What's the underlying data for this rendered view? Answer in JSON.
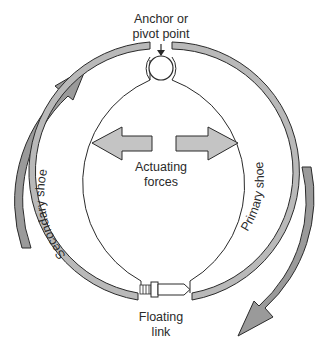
{
  "diagram": {
    "labels": {
      "anchor_line1": "Anchor or",
      "anchor_line2": "pivot point",
      "actuating_line1": "Actuating",
      "actuating_line2": "forces",
      "secondary_shoe": "Secondary shoe",
      "primary_shoe": "Primary shoe",
      "floating_line1": "Floating",
      "floating_line2": "link"
    },
    "components": [
      {
        "id": "anchor-pin",
        "label": "Anchor or pivot point"
      },
      {
        "id": "secondary-shoe",
        "label": "Secondary shoe"
      },
      {
        "id": "primary-shoe",
        "label": "Primary shoe"
      },
      {
        "id": "actuating-force-left",
        "label": "Actuating forces"
      },
      {
        "id": "actuating-force-right",
        "label": "Actuating forces"
      },
      {
        "id": "floating-link",
        "label": "Floating link"
      },
      {
        "id": "rotation-arrow-left",
        "label": "drum rotation"
      },
      {
        "id": "rotation-arrow-right",
        "label": "drum rotation"
      }
    ],
    "colors": {
      "lining": "#b9b9b9",
      "arrow_fill": "#9a9a9a",
      "force_arrow_fill": "#c4c4c4",
      "stroke": "#2a2a2a",
      "background": "#ffffff"
    }
  }
}
